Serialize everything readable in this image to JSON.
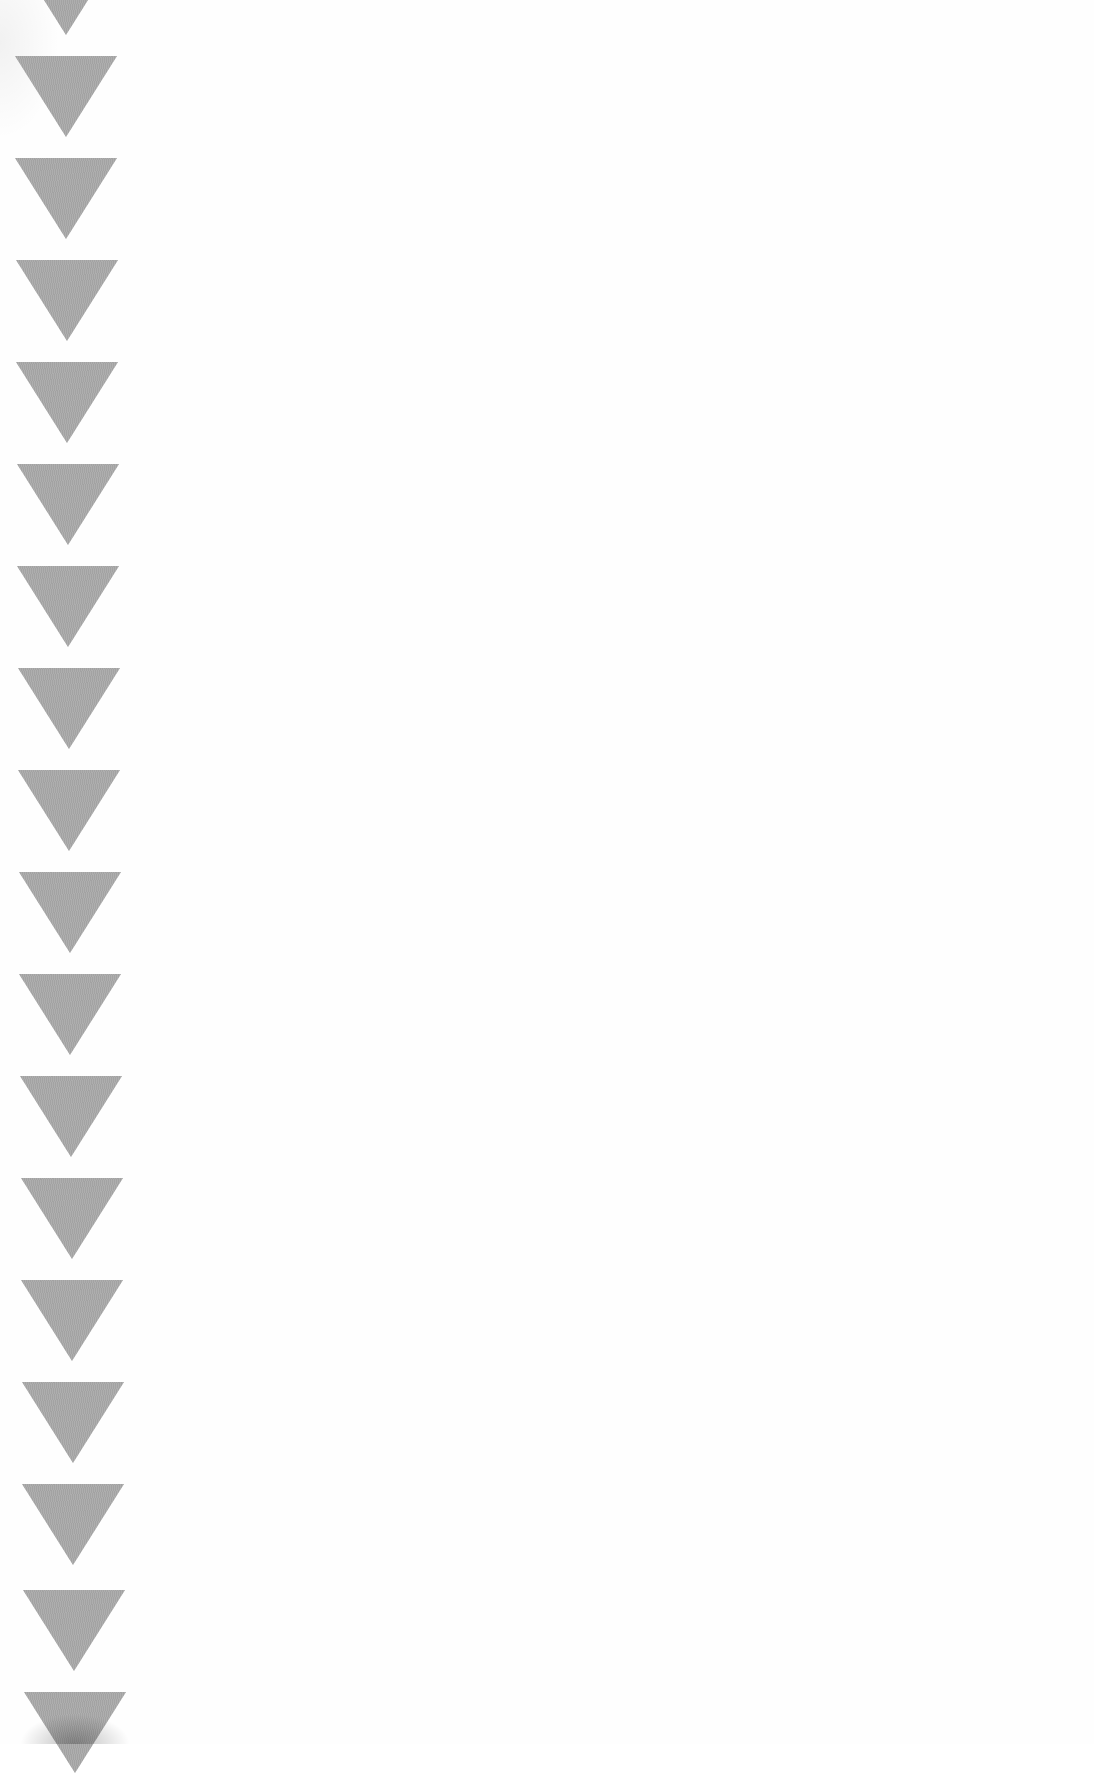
{
  "scene": {
    "description": "Photograph of white paper with a vertical column of gray downward-pointing triangles along the left edge",
    "background_color": "#ffffff",
    "triangle_color": "#a9a9a9"
  },
  "bunting": {
    "shape": "downward-triangle",
    "count_visible": 19,
    "width_px": 102,
    "height_px": 81,
    "spacing_px": 102,
    "triangles": [
      {
        "x": 15,
        "y": -46
      },
      {
        "x": 15,
        "y": 56
      },
      {
        "x": 15,
        "y": 158
      },
      {
        "x": 16,
        "y": 260
      },
      {
        "x": 16,
        "y": 362
      },
      {
        "x": 17,
        "y": 464
      },
      {
        "x": 17,
        "y": 566
      },
      {
        "x": 18,
        "y": 668
      },
      {
        "x": 18,
        "y": 770
      },
      {
        "x": 19,
        "y": 872
      },
      {
        "x": 19,
        "y": 974
      },
      {
        "x": 20,
        "y": 1076
      },
      {
        "x": 21,
        "y": 1178
      },
      {
        "x": 21,
        "y": 1280
      },
      {
        "x": 22,
        "y": 1382
      },
      {
        "x": 22,
        "y": 1484
      },
      {
        "x": 23,
        "y": 1590
      },
      {
        "x": 24,
        "y": 1692
      }
    ]
  }
}
